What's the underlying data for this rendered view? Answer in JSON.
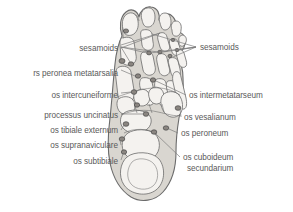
{
  "figure": {
    "background_color": "#ffffff",
    "foot_fill": "#d9d6d0",
    "bone_fill": "#f4f2ef",
    "outline_color": "#6b6b6b",
    "ossicle_fill": "#8a8580",
    "label_color": "#5a5a5a",
    "leader_color": "#7d7d7d"
  },
  "labels": {
    "left": [
      {
        "id": "sesamoids-left",
        "text": "sesamoids",
        "x": 118,
        "y": 48
      },
      {
        "id": "ossa-peronea-metatarsalia",
        "text": "rs peronea metatarsalia",
        "x": 118,
        "y": 73
      },
      {
        "id": "os-intercuneiforme",
        "text": "os intercuneiforme",
        "x": 118,
        "y": 96
      },
      {
        "id": "processus-uncinatus",
        "text": "processus uncinatus",
        "x": 118,
        "y": 117
      },
      {
        "id": "os-tibiale-externum",
        "text": "os tibiale externum",
        "x": 118,
        "y": 132
      },
      {
        "id": "os-supranaviculare",
        "text": "os supranaviculare",
        "x": 118,
        "y": 147
      },
      {
        "id": "os-subtibiale",
        "text": "os subtibiale",
        "x": 118,
        "y": 163
      }
    ],
    "right": [
      {
        "id": "sesamoids-right",
        "text": "sesamoids",
        "x": 199,
        "y": 50
      },
      {
        "id": "os-intermetatarseum",
        "text": "os intermetatarseum",
        "x": 189,
        "y": 98
      },
      {
        "id": "os-vesalianum",
        "text": "os vesalianum",
        "x": 184,
        "y": 120
      },
      {
        "id": "os-peroneum",
        "text": "os peroneum",
        "x": 181,
        "y": 136
      },
      {
        "id": "os-cuboideum-secundarium-1",
        "text": "os cuboideum",
        "x": 183,
        "y": 160
      },
      {
        "id": "os-cuboideum-secundarium-2",
        "text": "secundarium",
        "x": 187,
        "y": 171
      }
    ]
  },
  "ossicles": [
    {
      "id": "sesamoid-hallux-medial",
      "cx": 98,
      "cy": 60
    },
    {
      "id": "sesamoid-hallux-lateral",
      "cx": 107,
      "cy": 62
    },
    {
      "id": "sesamoid-hallux-proximal",
      "cx": 99,
      "cy": 31
    },
    {
      "id": "sesamoid-second-toe",
      "cx": 133,
      "cy": 53
    },
    {
      "id": "sesamoid-third-toe",
      "cx": 148,
      "cy": 52
    },
    {
      "id": "sesamoid-fourth-toe",
      "cx": 160,
      "cy": 55
    },
    {
      "id": "sesamoid-fifth-toe",
      "cx": 168,
      "cy": 50
    },
    {
      "id": "sesamoid-distal-lateral",
      "cx": 165,
      "cy": 40
    },
    {
      "id": "os-peroneum-metatarsalia-node",
      "cx": 141,
      "cy": 75
    },
    {
      "id": "os-intermetatarseum-node",
      "cx": 157,
      "cy": 80
    },
    {
      "id": "os-intercuneiforme-node",
      "cx": 136,
      "cy": 91
    },
    {
      "id": "ossicle-midfoot-a",
      "cx": 139,
      "cy": 104
    },
    {
      "id": "processus-uncinatus-node",
      "cx": 148,
      "cy": 113
    },
    {
      "id": "os-vesalianum-node",
      "cx": 172,
      "cy": 108
    },
    {
      "id": "os-tibiale-externum-node",
      "cx": 128,
      "cy": 125
    },
    {
      "id": "os-supranaviculare-node",
      "cx": 125,
      "cy": 140
    },
    {
      "id": "os-subtibiale-node",
      "cx": 126,
      "cy": 152
    },
    {
      "id": "os-peroneum-node",
      "cx": 160,
      "cy": 128
    },
    {
      "id": "os-cuboideum-secundarium-node",
      "cx": 151,
      "cy": 131
    }
  ]
}
